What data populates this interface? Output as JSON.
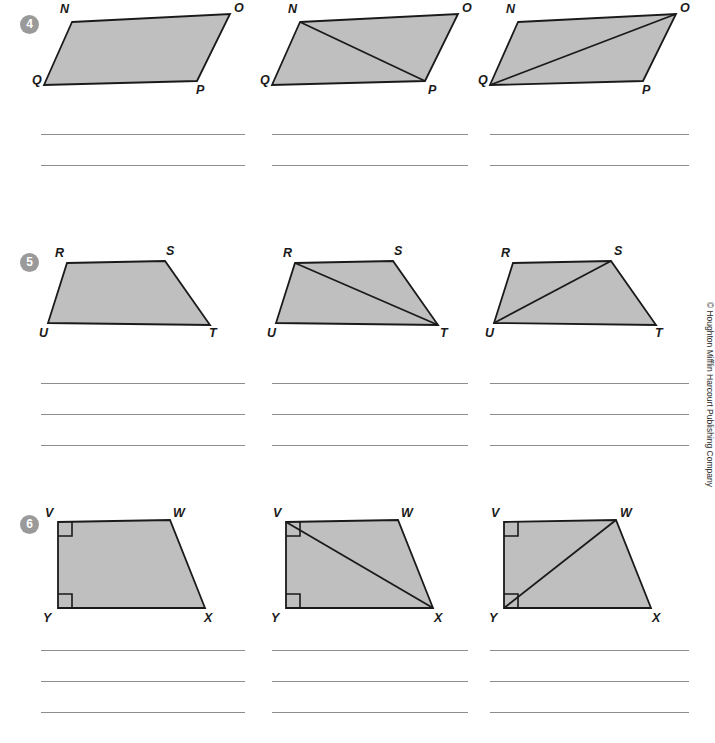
{
  "worksheet": {
    "copyright": "© Houghton Mifflin Harcourt Publishing Company",
    "shape_fill": "#bfbfbf",
    "shape_stroke": "#1a1a1a",
    "line_color": "#8d8d8d",
    "badge_color": "#9a9a9a"
  },
  "problems": [
    {
      "number": "4",
      "shape_name": "parallelogram",
      "vertex_labels": [
        "N",
        "O",
        "P",
        "Q"
      ],
      "answer_line_count": 2,
      "figures": [
        {
          "caption": "parallelogram-NOPQ-plain",
          "diagonal": "none"
        },
        {
          "caption": "parallelogram-NOPQ-diagonal-NP",
          "diagonal": "N-P"
        },
        {
          "caption": "parallelogram-NOPQ-diagonal-QO",
          "diagonal": "Q-O"
        }
      ]
    },
    {
      "number": "5",
      "shape_name": "trapezoid",
      "vertex_labels": [
        "R",
        "S",
        "T",
        "U"
      ],
      "answer_line_count": 3,
      "figures": [
        {
          "caption": "trapezoid-RSTU-plain",
          "diagonal": "none"
        },
        {
          "caption": "trapezoid-RSTU-diagonal-RT",
          "diagonal": "R-T"
        },
        {
          "caption": "trapezoid-RSTU-diagonal-US",
          "diagonal": "U-S"
        }
      ]
    },
    {
      "number": "6",
      "shape_name": "right trapezoid",
      "vertex_labels": [
        "V",
        "W",
        "X",
        "Y"
      ],
      "right_angle_marks": [
        "V",
        "Y"
      ],
      "answer_line_count": 3,
      "figures": [
        {
          "caption": "right-trapezoid-VWXY-plain",
          "diagonal": "none"
        },
        {
          "caption": "right-trapezoid-VWXY-diagonal-VX",
          "diagonal": "V-X"
        },
        {
          "caption": "right-trapezoid-VWXY-diagonal-YW",
          "diagonal": "Y-W"
        }
      ]
    }
  ]
}
